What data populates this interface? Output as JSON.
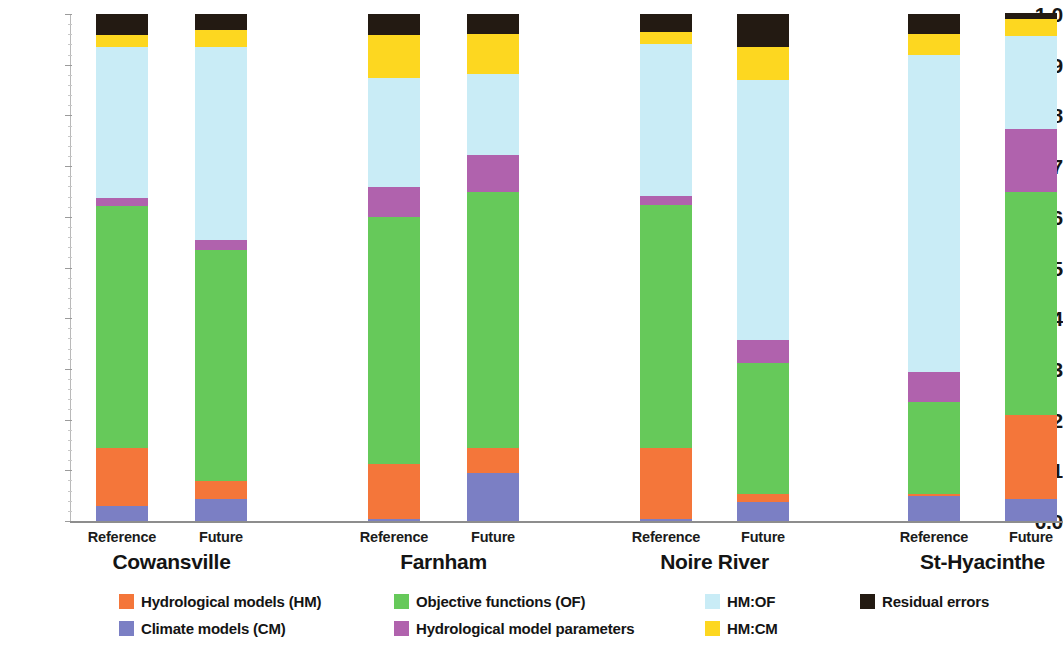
{
  "chart_data": {
    "type": "bar",
    "subtype": "stacked-bar-100pct",
    "title": "",
    "xlabel": "",
    "ylabel": "",
    "ylim": [
      0.0,
      1.0
    ],
    "grid": false,
    "legend_position": "bottom",
    "y_ticks": [
      "0.0",
      "0.1",
      "0.2",
      "0.3",
      "0.4",
      "0.5",
      "0.6",
      "0.7",
      "0.8",
      "0.9",
      "1.0"
    ],
    "y_tick_values": [
      0.0,
      0.1,
      0.2,
      0.3,
      0.4,
      0.5,
      0.6,
      0.7,
      0.8,
      0.9,
      1.0
    ],
    "groups": [
      "Cowansville",
      "Farnham",
      "Noire River",
      "St-Hyacinthe"
    ],
    "categories": [
      "Cowansville Reference",
      "Cowansville Future",
      "Farnham Reference",
      "Farnham Future",
      "Noire River Reference",
      "Noire River Future",
      "St-Hyacinthe Reference",
      "St-Hyacinthe Future"
    ],
    "scenarios": [
      "Reference",
      "Future"
    ],
    "series": [
      {
        "name": "Climate models (CM)",
        "key": "cm",
        "color": "#7b7fc4",
        "values": [
          0.03,
          0.045,
          0.005,
          0.095,
          0.005,
          0.038,
          0.05,
          0.045
        ]
      },
      {
        "name": "Hydrological models (HM)",
        "key": "hm",
        "color": "#f4763a",
        "values": [
          0.115,
          0.035,
          0.108,
          0.05,
          0.14,
          0.017,
          0.005,
          0.165
        ]
      },
      {
        "name": "Objective functions (OF)",
        "key": "of",
        "color": "#66c95a",
        "values": [
          0.477,
          0.455,
          0.487,
          0.505,
          0.48,
          0.258,
          0.18,
          0.44
        ]
      },
      {
        "name": "Hydrological model parameters",
        "key": "hmp",
        "color": "#b062ad",
        "values": [
          0.016,
          0.02,
          0.06,
          0.072,
          0.017,
          0.045,
          0.06,
          0.125
        ]
      },
      {
        "name": "HM:OF",
        "key": "hmof",
        "color": "#c9ecf6",
        "values": [
          0.297,
          0.38,
          0.215,
          0.16,
          0.3,
          0.512,
          0.625,
          0.182
        ]
      },
      {
        "name": "HM:CM",
        "key": "hmcm",
        "color": "#fdd720",
        "values": [
          0.025,
          0.035,
          0.085,
          0.08,
          0.023,
          0.065,
          0.042,
          0.035
        ]
      },
      {
        "name": "Residual errors",
        "key": "res",
        "color": "#231a12",
        "values": [
          0.04,
          0.03,
          0.04,
          0.038,
          0.035,
          0.065,
          0.038,
          0.01
        ]
      }
    ]
  },
  "axis": {
    "y_labels": [
      "1.0",
      "0.9",
      "0.8",
      "0.7",
      "0.6",
      "0.5",
      "0.4",
      "0.3",
      "0.2",
      "0.1",
      "0.0"
    ]
  },
  "xlabels": {
    "scenarios": [
      "Reference",
      "Future",
      "Reference",
      "Future",
      "Reference",
      "Future",
      "Reference",
      "Future"
    ],
    "sites": [
      "Cowansville",
      "Farnham",
      "Noire River",
      "St-Hyacinthe"
    ]
  },
  "legend": {
    "items": [
      {
        "label": "Hydrological models (HM)",
        "color": "#f4763a"
      },
      {
        "label": "Objective functions (OF)",
        "color": "#66c95a"
      },
      {
        "label": "HM:OF",
        "color": "#c9ecf6"
      },
      {
        "label": "Residual errors",
        "color": "#231a12"
      },
      {
        "label": "Climate models (CM)",
        "color": "#7b7fc4"
      },
      {
        "label": "Hydrological model parameters",
        "color": "#b062ad"
      },
      {
        "label": "HM:CM",
        "color": "#fdd720"
      }
    ]
  }
}
